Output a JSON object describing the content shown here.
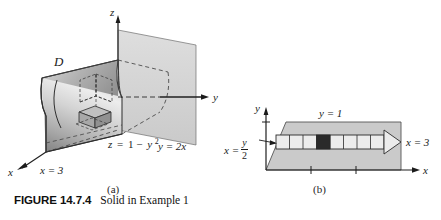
{
  "figure": {
    "number": "FIGURE 14.7.4",
    "caption": "Solid in Example 1",
    "panel_a_label": "(a)",
    "panel_b_label": "(b)"
  },
  "panel_a": {
    "name": "three-dimensional-solid",
    "axes": {
      "x": "x",
      "y": "y",
      "z": "z"
    },
    "labels": {
      "region": "D",
      "surface": "z = 1 − y²",
      "surface_parts": {
        "lhs": "z",
        "eq": "=",
        "rhs_lead": "1 −",
        "rhs_base": "y",
        "rhs_exp": "2"
      },
      "plane": "y = 2x",
      "front_face": "x = 3"
    }
  },
  "panel_b": {
    "name": "two-dimensional-region",
    "axes": {
      "x": "x",
      "y": "y"
    },
    "labels": {
      "top_boundary": "y = 1",
      "left_boundary_lhs": "x =",
      "left_boundary_numerator": "y",
      "left_boundary_denominator": "2",
      "right_boundary": "x = 3"
    },
    "strip": {
      "cell_count": 8,
      "highlighted_cell_index": 4
    }
  },
  "colors": {
    "ink": "#1b1b1b",
    "solid_light": "#e6e6e6",
    "solid_mid": "#bdbdbd",
    "solid_dark": "#8f8f8f",
    "plane_fill": "#d6d6d6",
    "region_fill": "#cccccc",
    "strip_fill": "#ececec",
    "highlight_fill": "#2a2a2a"
  }
}
